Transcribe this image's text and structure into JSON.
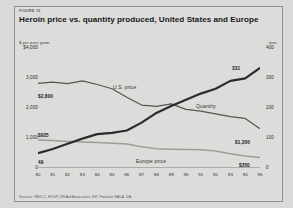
{
  "figure": {
    "number": "FIGURE 15",
    "title": "Heroin price vs. quantity produced, United States and Europe",
    "left_axis_caption": "$ per pure gram",
    "right_axis_caption": "tons",
    "source": "Sources: NNICC, HCSP, UN Aid Associates, KIP, Pakistan NALA, DA"
  },
  "chart_data": {
    "type": "line",
    "title": "Heroin price vs. quantity produced, United States and Europe",
    "xlabel": "",
    "ylabel": "$ per pure gram",
    "y2label": "tons",
    "ylim": [
      0,
      4000
    ],
    "y2lim": [
      0,
      400
    ],
    "grid": false,
    "legend": "inline-annotations",
    "x": [
      "80",
      "81",
      "82",
      "83",
      "84",
      "85",
      "86",
      "87",
      "88",
      "89",
      "90",
      "91",
      "92",
      "93",
      "94",
      "95"
    ],
    "y_ticks": [
      "$4,000",
      "3,000",
      "2,000",
      "1,000",
      "0"
    ],
    "y_tick_values": [
      4000,
      3000,
      2000,
      1000,
      0
    ],
    "y2_ticks": [
      "400",
      "300",
      "200",
      "100",
      "0"
    ],
    "y2_tick_values": [
      400,
      300,
      200,
      100,
      0
    ],
    "series": [
      {
        "name": "U.S. price",
        "axis": "left",
        "unit": "$ per pure gram",
        "color": "#55554f",
        "values": [
          2800,
          2840,
          2790,
          2880,
          2760,
          2620,
          2340,
          2080,
          2040,
          2120,
          1940,
          1880,
          1790,
          1700,
          1640,
          1300
        ],
        "start_label": "$2,800",
        "end_label": "$1,300"
      },
      {
        "name": "Quantity",
        "axis": "right",
        "unit": "tons",
        "color": "#2b2b2b",
        "values": [
          49,
          63,
          80,
          97,
          112,
          116,
          124,
          150,
          182,
          205,
          226,
          246,
          262,
          288,
          296,
          331
        ],
        "start_label": "49",
        "end_label": "331"
      },
      {
        "name": "Europe price",
        "axis": "left",
        "unit": "$ per pure gram",
        "color": "#9d9d97",
        "values": [
          925,
          905,
          880,
          860,
          840,
          820,
          790,
          700,
          640,
          620,
          610,
          600,
          560,
          470,
          400,
          350
        ],
        "start_label": "$925",
        "end_label": "$350"
      }
    ],
    "annotations": [
      {
        "text": "U.S. price",
        "series": "U.S. price"
      },
      {
        "text": "Quantity",
        "series": "Quantity"
      },
      {
        "text": "Europe price",
        "series": "Europe price"
      },
      {
        "text": "$2,800",
        "kind": "value"
      },
      {
        "text": "$1,300",
        "kind": "value"
      },
      {
        "text": "49",
        "kind": "value"
      },
      {
        "text": "331",
        "kind": "value"
      },
      {
        "text": "$925",
        "kind": "value"
      },
      {
        "text": "$350",
        "kind": "value"
      }
    ]
  }
}
